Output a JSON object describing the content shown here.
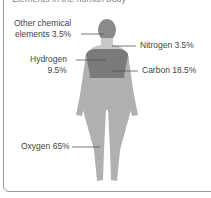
{
  "header": {
    "cut_text": "Elements in the human body"
  },
  "labels": {
    "other": {
      "line1": "Other chemical",
      "line2": "elements 3.5%"
    },
    "nitrogen": "Nitrogen 3.5%",
    "hydrogen": {
      "line1": "Hydrogen",
      "line2": "9.5%"
    },
    "carbon": "Carbon 18.5%",
    "oxygen": "Oxygen 65%"
  },
  "colors": {
    "head": "#8a8a8a",
    "torso": "#7a7a7a",
    "neck": "#c8c8c8",
    "body": "#b0b0b0",
    "border": "#9a9a9a"
  }
}
